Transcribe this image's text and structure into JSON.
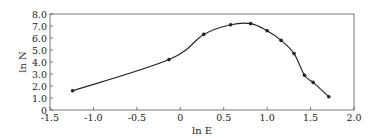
{
  "chart_data": {
    "type": "line",
    "title": "",
    "xlabel": "ln E",
    "ylabel": "ln N",
    "xlim": [
      -1.5,
      2.0
    ],
    "ylim": [
      0,
      8.0
    ],
    "grid": false,
    "legend": null,
    "x_ticks": [
      "-1.5",
      "-1.0",
      "-0.5",
      "0",
      "0.5",
      "1.0",
      "1.5",
      "2.0"
    ],
    "x_tick_values": [
      -1.5,
      -1.0,
      -0.5,
      0,
      0.5,
      1.0,
      1.5,
      2.0
    ],
    "y_ticks": [
      "0",
      "1.0",
      "2.0",
      "3.0",
      "4.0",
      "5.0",
      "6.0",
      "7.0",
      "8.0"
    ],
    "y_tick_values": [
      0,
      1,
      2,
      3,
      4,
      5,
      6,
      7,
      8
    ],
    "series": [
      {
        "name": "ln N vs ln E",
        "x": [
          -1.24,
          -0.13,
          0.27,
          0.58,
          0.81,
          1.0,
          1.16,
          1.31,
          1.43,
          1.53,
          1.71
        ],
        "y": [
          1.6,
          4.2,
          6.3,
          7.1,
          7.2,
          6.6,
          5.8,
          4.7,
          2.9,
          2.3,
          1.1
        ],
        "color": "#222222",
        "marker": "circle"
      }
    ]
  },
  "colors": {
    "line": "#222222",
    "axis": "#444444",
    "background": "#ffffff"
  }
}
